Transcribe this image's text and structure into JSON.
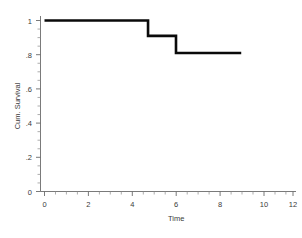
{
  "chart_data": {
    "type": "line",
    "subtype": "step-kaplan-meier",
    "title": "",
    "xlabel": "Time",
    "ylabel": "Cum. Survival",
    "xlim": [
      0,
      12
    ],
    "ylim": [
      0,
      1
    ],
    "grid": false,
    "legend": null,
    "x_ticks": [
      0,
      2,
      4,
      6,
      8,
      10,
      12
    ],
    "x_tick_labels": [
      "0",
      "2",
      "4",
      "6",
      "8",
      "10",
      "12"
    ],
    "x_minor_tick_interval": 0.5,
    "y_ticks": [
      0,
      0.2,
      0.4,
      0.6,
      0.8,
      1
    ],
    "y_tick_labels": [
      "0",
      ".2",
      ".4",
      ".6",
      ".8",
      "1"
    ],
    "y_minor_tick_interval": 0.05,
    "series": [
      {
        "name": "Cum. Survival",
        "color": "#0a0a0a",
        "x": [
          0,
          5.0,
          5.0,
          6.35,
          6.35,
          9.5
        ],
        "y": [
          1.0,
          1.0,
          0.91,
          0.91,
          0.81,
          0.81
        ],
        "steps": [
          {
            "time_start": 0,
            "time_end": 5.0,
            "survival": 1.0
          },
          {
            "time_start": 5.0,
            "time_end": 6.35,
            "survival": 0.91
          },
          {
            "time_start": 6.35,
            "time_end": 9.5,
            "survival": 0.81
          }
        ]
      }
    ]
  },
  "axis": {
    "x_title": "Time",
    "y_title": "Cum. Survival"
  },
  "colors": {
    "curve": "#0a0a0a",
    "axis": "#6b6b6b",
    "text": "#3a3a3a",
    "background": "#ffffff"
  }
}
